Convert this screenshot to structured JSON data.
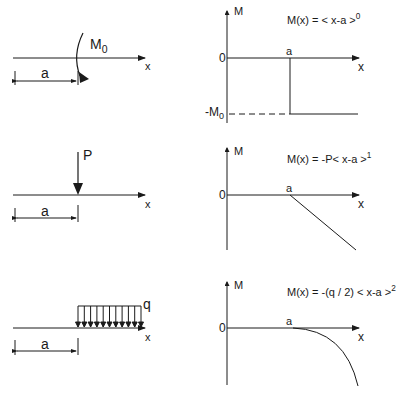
{
  "diagrams": [
    {
      "id": "moment",
      "load": {
        "type": "concentrated-moment",
        "label": "M",
        "label_sub": "0",
        "dimension": "a",
        "axis": "x"
      },
      "graph": {
        "y_axis_label": "M",
        "x_axis_label": "x",
        "origin_label": "0",
        "a_label": "a",
        "neg_label": "-M",
        "neg_label_sub": "0",
        "equation_prefix": "M(x) = < x-a >",
        "equation_exponent": "0"
      }
    },
    {
      "id": "point-load",
      "load": {
        "type": "point-force",
        "label": "P",
        "dimension": "a",
        "axis": "x"
      },
      "graph": {
        "y_axis_label": "M",
        "x_axis_label": "x",
        "origin_label": "0",
        "a_label": "a",
        "equation_prefix": "M(x) = -P< x-a >",
        "equation_exponent": "1"
      }
    },
    {
      "id": "distributed-load",
      "load": {
        "type": "uniform-distributed",
        "label": "q",
        "dimension": "a",
        "axis": "x"
      },
      "graph": {
        "y_axis_label": "M",
        "x_axis_label": "x",
        "origin_label": "0",
        "a_label": "a",
        "equation_prefix": "M(x) = -(q / 2) < x-a >",
        "equation_exponent": "2"
      }
    }
  ],
  "colors": {
    "line": "#1a1a1a",
    "background": "#ffffff"
  }
}
